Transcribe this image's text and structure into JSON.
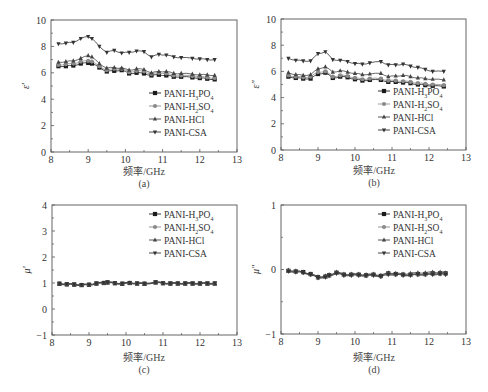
{
  "figure": {
    "series_names": [
      "PANI-H3PO4",
      "PANI-H2SO4",
      "PANI-HCl",
      "PANI-CSA"
    ],
    "series_legend_html": [
      "PANI-H<tspan baseline-shift='sub' font-size='6'>3</tspan>PO<tspan baseline-shift='sub' font-size='6'>4</tspan>",
      "PANI-H<tspan baseline-shift='sub' font-size='6'>2</tspan>SO<tspan baseline-shift='sub' font-size='6'>4</tspan>",
      "PANI-HCl",
      "PANI-CSA"
    ],
    "series_colors": [
      "#1a1a1a",
      "#8a8a8a",
      "#444444",
      "#333333"
    ],
    "series_markers": [
      "square",
      "circle",
      "triangle-up",
      "triangle-down"
    ]
  },
  "chart_data": [
    {
      "id": "a",
      "type": "line",
      "panel_label": "(a)",
      "xlabel": "频率/GHz",
      "ylabel": "ε′",
      "xlim": [
        8,
        13
      ],
      "ylim": [
        0,
        10
      ],
      "xticks": [
        8,
        9,
        10,
        11,
        12,
        13
      ],
      "yticks": [
        0,
        2,
        4,
        6,
        8,
        10
      ],
      "grid": false,
      "legend_position": "lower right",
      "x": [
        8.2,
        8.4,
        8.6,
        8.8,
        9.0,
        9.1,
        9.3,
        9.5,
        9.7,
        9.9,
        10.1,
        10.3,
        10.5,
        10.7,
        10.9,
        11.1,
        11.3,
        11.5,
        11.8,
        12.0,
        12.2,
        12.4
      ],
      "series": [
        {
          "name": "PANI-H3PO4",
          "values": [
            6.5,
            6.5,
            6.55,
            6.7,
            6.75,
            6.7,
            6.4,
            6.1,
            6.15,
            6.2,
            5.95,
            6.0,
            5.95,
            5.8,
            5.85,
            5.8,
            5.7,
            5.7,
            5.65,
            5.6,
            5.55,
            5.5
          ]
        },
        {
          "name": "PANI-H2SO4",
          "values": [
            6.6,
            6.65,
            6.7,
            6.85,
            6.9,
            6.85,
            6.5,
            6.2,
            6.3,
            6.3,
            6.05,
            6.15,
            6.1,
            5.9,
            6.0,
            5.95,
            5.8,
            5.8,
            5.75,
            5.7,
            5.65,
            5.6
          ]
        },
        {
          "name": "PANI-HCl",
          "values": [
            6.8,
            6.85,
            6.9,
            7.1,
            7.3,
            7.2,
            6.7,
            6.35,
            6.4,
            6.35,
            6.2,
            6.3,
            6.25,
            6.0,
            6.1,
            6.1,
            5.95,
            5.95,
            5.9,
            5.85,
            5.85,
            5.8
          ]
        },
        {
          "name": "PANI-CSA",
          "values": [
            8.2,
            8.25,
            8.3,
            8.6,
            8.75,
            8.6,
            8.0,
            7.55,
            7.7,
            7.5,
            7.55,
            7.65,
            7.6,
            7.2,
            7.4,
            7.35,
            7.2,
            7.15,
            7.1,
            7.05,
            7.0,
            7.0
          ]
        }
      ]
    },
    {
      "id": "b",
      "type": "line",
      "panel_label": "(b)",
      "xlabel": "频率/GHz",
      "ylabel": "ε″",
      "xlim": [
        8,
        13
      ],
      "ylim": [
        0,
        10
      ],
      "xticks": [
        8,
        9,
        10,
        11,
        12,
        13
      ],
      "yticks": [
        0,
        2,
        4,
        6,
        8,
        10
      ],
      "grid": false,
      "legend_position": "lower right",
      "x": [
        8.2,
        8.4,
        8.6,
        8.8,
        9.0,
        9.2,
        9.4,
        9.6,
        9.8,
        10.0,
        10.2,
        10.4,
        10.7,
        10.9,
        11.1,
        11.3,
        11.5,
        11.7,
        11.9,
        12.1,
        12.4
      ],
      "series": [
        {
          "name": "PANI-H3PO4",
          "values": [
            5.6,
            5.5,
            5.45,
            5.45,
            5.8,
            5.9,
            5.5,
            5.6,
            5.55,
            5.4,
            5.3,
            5.35,
            5.35,
            5.2,
            5.2,
            5.15,
            5.1,
            5.0,
            4.95,
            4.9,
            4.85
          ]
        },
        {
          "name": "PANI-H2SO4",
          "values": [
            5.7,
            5.6,
            5.55,
            5.6,
            5.95,
            6.0,
            5.6,
            5.7,
            5.65,
            5.5,
            5.4,
            5.45,
            5.45,
            5.3,
            5.3,
            5.25,
            5.2,
            5.1,
            5.05,
            5.0,
            4.95
          ]
        },
        {
          "name": "PANI-HCl",
          "values": [
            5.9,
            5.75,
            5.7,
            5.75,
            6.2,
            6.35,
            5.95,
            6.05,
            5.95,
            5.85,
            5.75,
            5.8,
            5.85,
            5.6,
            5.65,
            5.7,
            5.6,
            5.5,
            5.45,
            5.4,
            5.35
          ]
        },
        {
          "name": "PANI-CSA",
          "values": [
            7.0,
            6.85,
            6.8,
            6.8,
            7.35,
            7.5,
            6.9,
            6.85,
            6.75,
            6.6,
            6.55,
            6.65,
            6.75,
            6.5,
            6.5,
            6.55,
            6.4,
            6.3,
            6.15,
            6.0,
            6.0
          ]
        }
      ]
    },
    {
      "id": "c",
      "type": "line",
      "panel_label": "(c)",
      "xlabel": "频率/GHz",
      "ylabel": "μ′",
      "xlim": [
        8,
        13
      ],
      "ylim": [
        -1,
        4
      ],
      "xticks": [
        8,
        9,
        10,
        11,
        12,
        13
      ],
      "yticks": [
        -1,
        0,
        1,
        2,
        3,
        4
      ],
      "grid": false,
      "legend_position": "upper right",
      "x": [
        8.2,
        8.4,
        8.6,
        8.8,
        9.0,
        9.2,
        9.4,
        9.5,
        9.7,
        9.9,
        10.1,
        10.3,
        10.5,
        10.8,
        11.0,
        11.2,
        11.4,
        11.6,
        11.8,
        12.0,
        12.2,
        12.4
      ],
      "series": [
        {
          "name": "PANI-H3PO4",
          "values": [
            0.97,
            0.95,
            0.94,
            0.92,
            0.93,
            0.98,
            1.0,
            1.02,
            0.99,
            0.97,
            1.0,
            0.98,
            0.97,
            1.02,
            0.99,
            0.98,
            0.98,
            0.98,
            0.98,
            0.98,
            0.98,
            0.98
          ]
        },
        {
          "name": "PANI-H2SO4",
          "values": [
            0.98,
            0.96,
            0.95,
            0.93,
            0.94,
            0.99,
            1.01,
            1.03,
            1.0,
            0.98,
            1.01,
            0.99,
            0.98,
            1.03,
            1.0,
            0.99,
            0.99,
            0.99,
            0.99,
            0.99,
            0.99,
            0.99
          ]
        },
        {
          "name": "PANI-HCl",
          "values": [
            0.96,
            0.94,
            0.93,
            0.91,
            0.92,
            0.97,
            0.99,
            1.01,
            0.98,
            0.96,
            0.99,
            0.97,
            0.96,
            1.01,
            0.98,
            0.97,
            0.97,
            0.97,
            0.97,
            0.97,
            0.97,
            0.97
          ]
        },
        {
          "name": "PANI-CSA",
          "values": [
            0.99,
            0.97,
            0.96,
            0.94,
            0.95,
            1.0,
            1.02,
            1.04,
            1.01,
            0.99,
            1.02,
            1.0,
            0.99,
            1.04,
            1.01,
            1.0,
            1.0,
            1.0,
            1.0,
            1.0,
            1.0,
            1.0
          ]
        }
      ]
    },
    {
      "id": "d",
      "type": "line",
      "panel_label": "(d)",
      "xlabel": "频率/GHz",
      "ylabel": "μ″",
      "xlim": [
        8,
        13
      ],
      "ylim": [
        -1,
        1
      ],
      "xticks": [
        8,
        9,
        10,
        11,
        12,
        13
      ],
      "yticks": [
        -1,
        0,
        1
      ],
      "grid": false,
      "legend_position": "upper right",
      "x": [
        8.2,
        8.4,
        8.6,
        8.8,
        9.0,
        9.2,
        9.3,
        9.5,
        9.7,
        9.9,
        10.1,
        10.3,
        10.5,
        10.7,
        10.9,
        11.1,
        11.3,
        11.5,
        11.7,
        11.9,
        12.1,
        12.3,
        12.45
      ],
      "series": [
        {
          "name": "PANI-H3PO4",
          "values": [
            -0.02,
            -0.03,
            -0.04,
            -0.07,
            -0.12,
            -0.11,
            -0.09,
            -0.05,
            -0.08,
            -0.08,
            -0.08,
            -0.09,
            -0.08,
            -0.1,
            -0.06,
            -0.07,
            -0.08,
            -0.08,
            -0.07,
            -0.07,
            -0.06,
            -0.06,
            -0.06
          ]
        },
        {
          "name": "PANI-H2SO4",
          "values": [
            -0.02,
            -0.03,
            -0.05,
            -0.08,
            -0.13,
            -0.12,
            -0.1,
            -0.06,
            -0.09,
            -0.09,
            -0.09,
            -0.1,
            -0.09,
            -0.11,
            -0.07,
            -0.08,
            -0.09,
            -0.09,
            -0.08,
            -0.08,
            -0.07,
            -0.07,
            -0.07
          ]
        },
        {
          "name": "PANI-HCl",
          "values": [
            -0.01,
            -0.02,
            -0.04,
            -0.07,
            -0.11,
            -0.1,
            -0.08,
            -0.04,
            -0.07,
            -0.07,
            -0.07,
            -0.08,
            -0.07,
            -0.09,
            -0.05,
            -0.06,
            -0.07,
            -0.06,
            -0.05,
            -0.05,
            -0.04,
            -0.04,
            -0.05
          ]
        },
        {
          "name": "PANI-CSA",
          "values": [
            -0.03,
            -0.04,
            -0.05,
            -0.08,
            -0.13,
            -0.12,
            -0.1,
            -0.06,
            -0.09,
            -0.09,
            -0.09,
            -0.1,
            -0.09,
            -0.11,
            -0.08,
            -0.08,
            -0.09,
            -0.09,
            -0.08,
            -0.08,
            -0.08,
            -0.07,
            -0.08
          ]
        }
      ]
    }
  ],
  "panels": {
    "a": {
      "label": "(a)",
      "xlabel": "频率/GHz",
      "ylabel": "ε′"
    },
    "b": {
      "label": "(b)",
      "xlabel": "频率/GHz",
      "ylabel": "ε″"
    },
    "c": {
      "label": "(c)",
      "xlabel": "频率/GHz",
      "ylabel": "μ′"
    },
    "d": {
      "label": "(d)",
      "xlabel": "频率/GHz",
      "ylabel": "μ″"
    }
  }
}
